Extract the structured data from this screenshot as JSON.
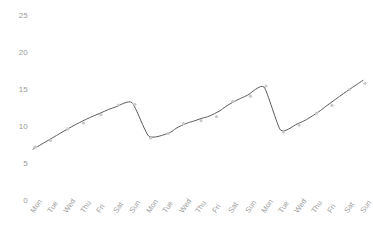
{
  "chart_data": {
    "type": "line",
    "title": "",
    "subtitle": "",
    "xlabel": "",
    "ylabel": "",
    "xlim": [
      0,
      20
    ],
    "ylim": [
      0,
      26
    ],
    "grid": false,
    "legend": "none",
    "line_color": "#5a5a5a",
    "marker_color": "#c9c9c9",
    "axis_label_color": "#9a9a9a",
    "background_color": "#ffffff",
    "x_tick_labels": [
      "Mon",
      "Tue",
      "Wed",
      "Thu",
      "Fri",
      "Sat",
      "Sun",
      "Mon",
      "Tue",
      "Wed",
      "Thu",
      "Fri",
      "Sat",
      "Sun",
      "Mon",
      "Tue",
      "Wed",
      "Thu",
      "Fri",
      "Sat",
      "Sun"
    ],
    "y_tick_labels": [
      "0",
      "5",
      "10",
      "15",
      "20",
      "25"
    ],
    "y_tick_values": [
      0,
      5,
      10,
      15,
      20,
      25
    ],
    "categories": [
      "Mon",
      "Tue",
      "Wed",
      "Thu",
      "Fri",
      "Sat",
      "Sun",
      "Mon",
      "Tue",
      "Wed",
      "Thu",
      "Fri",
      "Sat",
      "Sun",
      "Mon",
      "Tue",
      "Wed",
      "Thu",
      "Fri",
      "Sat",
      "Sun"
    ],
    "series": [
      {
        "name": "value",
        "values": [
          7.0,
          8.3,
          9.6,
          10.8,
          11.8,
          12.7,
          13.3,
          8.8,
          9.0,
          10.2,
          11.0,
          11.8,
          13.2,
          14.3,
          15.4,
          9.6,
          10.4,
          11.6,
          13.2,
          14.8,
          16.3
        ]
      }
    ],
    "marker_values": [
      7.0,
      8.3,
      9.6,
      10.8,
      11.8,
      12.7,
      13.3,
      8.8,
      9.0,
      10.2,
      11.0,
      11.8,
      13.2,
      14.3,
      15.4,
      9.6,
      10.4,
      11.6,
      13.2,
      14.8,
      16.3
    ]
  }
}
